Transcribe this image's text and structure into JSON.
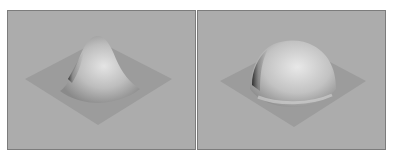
{
  "figure": {
    "panels": [
      {
        "name": "gaussian-peak-surface",
        "shape": "peak",
        "colors": {
          "background": "#acacac",
          "plane": "#9c9c9c",
          "highlight": "#e4e4e4",
          "shadow": "#303030"
        }
      },
      {
        "name": "dome-surface",
        "shape": "dome",
        "colors": {
          "background": "#acacac",
          "plane": "#9c9c9c",
          "highlight": "#e8e8e8",
          "shadow": "#282828"
        }
      }
    ]
  }
}
